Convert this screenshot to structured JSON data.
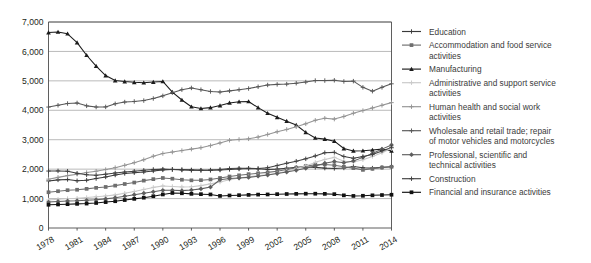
{
  "chart_data": {
    "type": "line",
    "title": "",
    "subtitle": "",
    "xlabel": "",
    "ylabel": "",
    "grid": "horizontal",
    "legend_position": "right",
    "ylim": [
      0,
      7000
    ],
    "ytick_labels": [
      "0",
      "1,000",
      "2,000",
      "3,000",
      "4,000",
      "5,000",
      "6,000",
      "7,000"
    ],
    "ytick_values": [
      0,
      1000,
      2000,
      3000,
      4000,
      5000,
      6000,
      7000
    ],
    "x": [
      1978,
      1979,
      1980,
      1981,
      1982,
      1983,
      1984,
      1985,
      1986,
      1987,
      1988,
      1989,
      1990,
      1991,
      1992,
      1993,
      1994,
      1995,
      1996,
      1997,
      1998,
      1999,
      2000,
      2001,
      2002,
      2003,
      2004,
      2005,
      2006,
      2007,
      2008,
      2009,
      2010,
      2011,
      2012,
      2013,
      2014
    ],
    "xtick_labels": [
      "1978",
      "1981",
      "1984",
      "1987",
      "1990",
      "1993",
      "1996",
      "1999",
      "2002",
      "2005",
      "2008",
      "2011",
      "2014"
    ],
    "xtick_values": [
      1978,
      1981,
      1984,
      1987,
      1990,
      1993,
      1996,
      1999,
      2002,
      2005,
      2008,
      2011,
      2014
    ],
    "series": [
      {
        "name": "Education",
        "color": "#3a3a3a",
        "marker": "plus",
        "values": [
          1600,
          1635,
          1650,
          1605,
          1625,
          1680,
          1735,
          1800,
          1855,
          1880,
          1905,
          1940,
          1975,
          1990,
          1985,
          1975,
          1965,
          1960,
          1970,
          1990,
          2005,
          2020,
          2010,
          1990,
          2000,
          2030,
          2060,
          2075,
          2060,
          2035,
          2025,
          2040,
          2090,
          2050,
          2035,
          2060,
          2080
        ]
      },
      {
        "name": "Accommodation and food service activities",
        "color": "#6e6e6e",
        "marker": "square",
        "values": [
          1215,
          1250,
          1285,
          1300,
          1330,
          1365,
          1395,
          1440,
          1495,
          1545,
          1610,
          1660,
          1700,
          1675,
          1640,
          1620,
          1625,
          1650,
          1700,
          1750,
          1790,
          1830,
          1860,
          1890,
          1930,
          1985,
          2050,
          2105,
          2145,
          2160,
          2130,
          2080,
          2035,
          1975,
          2010,
          2055,
          2080
        ]
      },
      {
        "name": "Manufacturing",
        "color": "#1c1c1c",
        "marker": "triangle",
        "values": [
          6640,
          6660,
          6600,
          6300,
          5870,
          5500,
          5180,
          5010,
          4975,
          4950,
          4935,
          4960,
          4980,
          4620,
          4350,
          4120,
          4060,
          4090,
          4160,
          4250,
          4290,
          4300,
          4090,
          3900,
          3760,
          3630,
          3500,
          3250,
          3060,
          3020,
          2950,
          2700,
          2620,
          2625,
          2650,
          2680,
          2620
        ]
      },
      {
        "name": "Administrative and support service activities",
        "color": "#c9c9c9",
        "marker": "plus",
        "values": [
          950,
          975,
          1000,
          1010,
          1035,
          1060,
          1090,
          1125,
          1180,
          1240,
          1310,
          1380,
          1430,
          1410,
          1395,
          1400,
          1440,
          1500,
          1560,
          1640,
          1700,
          1740,
          1780,
          1810,
          1860,
          1930,
          2010,
          2110,
          2230,
          2330,
          2400,
          2270,
          2240,
          2320,
          2430,
          2560,
          2700
        ]
      },
      {
        "name": "Human health and social work activities",
        "color": "#949494",
        "marker": "plus",
        "values": [
          1660,
          1720,
          1780,
          1830,
          1885,
          1930,
          1985,
          2050,
          2130,
          2220,
          2320,
          2440,
          2530,
          2580,
          2630,
          2680,
          2730,
          2800,
          2890,
          2980,
          3010,
          3030,
          3090,
          3180,
          3270,
          3350,
          3440,
          3540,
          3660,
          3730,
          3700,
          3790,
          3900,
          3990,
          4080,
          4170,
          4260
        ]
      },
      {
        "name": "Wholesale and retail trade; repair of motor vehicles and motorcycles",
        "color": "#575757",
        "marker": "plus",
        "values": [
          4110,
          4170,
          4230,
          4250,
          4150,
          4110,
          4115,
          4220,
          4280,
          4300,
          4330,
          4400,
          4490,
          4600,
          4700,
          4760,
          4700,
          4640,
          4620,
          4660,
          4700,
          4740,
          4800,
          4860,
          4880,
          4890,
          4920,
          4960,
          5010,
          5010,
          5020,
          4980,
          4990,
          4780,
          4650,
          4780,
          4900
        ]
      },
      {
        "name": "Professional, scientific and technical activities",
        "color": "#5e5e5e",
        "marker": "diamond",
        "values": [
          880,
          900,
          920,
          925,
          940,
          960,
          990,
          1030,
          1080,
          1130,
          1180,
          1230,
          1280,
          1280,
          1270,
          1290,
          1330,
          1390,
          1640,
          1680,
          1700,
          1720,
          1760,
          1800,
          1850,
          1900,
          1960,
          2030,
          2110,
          2200,
          2260,
          2220,
          2280,
          2400,
          2530,
          2680,
          2820
        ]
      },
      {
        "name": "Construction",
        "color": "#404040",
        "marker": "plus",
        "values": [
          1935,
          1940,
          1930,
          1860,
          1810,
          1790,
          1830,
          1870,
          1900,
          1930,
          1960,
          1990,
          2000,
          1990,
          1970,
          1960,
          1960,
          1970,
          1990,
          2020,
          2030,
          2030,
          2020,
          2050,
          2120,
          2200,
          2270,
          2350,
          2450,
          2560,
          2570,
          2430,
          2370,
          2430,
          2500,
          2620,
          2740
        ]
      },
      {
        "name": "Financial and insurance activities",
        "color": "#111111",
        "marker": "square",
        "values": [
          790,
          800,
          810,
          820,
          830,
          850,
          880,
          910,
          950,
          990,
          1030,
          1080,
          1140,
          1190,
          1180,
          1160,
          1150,
          1140,
          1090,
          1105,
          1115,
          1125,
          1135,
          1140,
          1150,
          1155,
          1160,
          1165,
          1165,
          1160,
          1150,
          1110,
          1090,
          1095,
          1110,
          1120,
          1130
        ]
      }
    ]
  },
  "legend": {
    "items": [
      {
        "label": "Education"
      },
      {
        "label": "Accommodation and food service activities"
      },
      {
        "label": "Manufacturing"
      },
      {
        "label": "Administrative and support service activities"
      },
      {
        "label": "Human health and social work activities"
      },
      {
        "label": "Wholesale and retail trade; repair of motor vehicles and motorcycles"
      },
      {
        "label": "Professional, scientific and technical activities"
      },
      {
        "label": "Construction"
      },
      {
        "label": "Financial and insurance activities"
      }
    ]
  }
}
